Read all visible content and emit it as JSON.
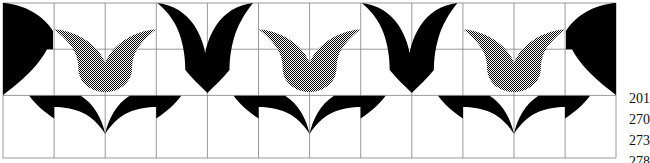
{
  "figure": {
    "grid": {
      "x_start": 3,
      "y_start": 3,
      "cell_width": 51.1,
      "cell_height": 46.2,
      "columns": 12,
      "rows": 3,
      "line_color": "#808080",
      "line_width": 0.8,
      "visible": true
    },
    "colors": {
      "black": "#000000",
      "stipple_gray": "#8f8f8f",
      "background": "#ffffff",
      "grid": "#808080",
      "text": "#111111"
    },
    "motifs": {
      "top_row": [
        {
          "kind": "half-black-wing-left",
          "center_column": 0,
          "fill": "black"
        },
        {
          "kind": "tulip",
          "center_column": 2,
          "fill": "stipple"
        },
        {
          "kind": "v-bird",
          "center_column": 4,
          "fill": "black"
        },
        {
          "kind": "tulip",
          "center_column": 6,
          "fill": "stipple"
        },
        {
          "kind": "v-bird",
          "center_column": 8,
          "fill": "black"
        },
        {
          "kind": "tulip",
          "center_column": 10,
          "fill": "stipple"
        },
        {
          "kind": "half-black-wing-right",
          "center_column": 12,
          "fill": "black"
        }
      ],
      "bottom_row": [
        {
          "kind": "swallow-wings",
          "center_column": 2,
          "fill": "black"
        },
        {
          "kind": "swallow-wings",
          "center_column": 6,
          "fill": "black"
        },
        {
          "kind": "swallow-wings",
          "center_column": 10,
          "fill": "black"
        }
      ]
    }
  },
  "labels": {
    "values": [
      "201",
      "270",
      "273",
      "278"
    ]
  }
}
